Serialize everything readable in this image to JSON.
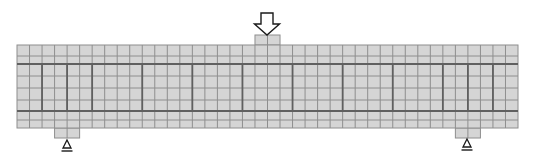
{
  "diagram": {
    "title": "Reinforced concrete beam finite element mesh with three-point loading",
    "canvas": {
      "width": 534,
      "height": 163
    },
    "colors": {
      "cell_fill": "#d5d5d5",
      "grid_line": "#8e8e8e",
      "rebar": "#606060",
      "stirrup": "#606060",
      "arrow_outline": "#1a1a1a",
      "arrow_fill": "#ffffff"
    },
    "beam": {
      "x": 17,
      "y": 45,
      "width": 501,
      "height": 83,
      "columns": 40,
      "row_lines_y": [
        56,
        64,
        76,
        88,
        100,
        111,
        120
      ]
    },
    "longitudinal_rebars": [
      {
        "name": "top-rebar",
        "y": 64
      },
      {
        "name": "bottom-rebar",
        "y": 111
      }
    ],
    "stirrups_column_index": [
      2,
      4,
      6,
      10,
      14,
      18,
      22,
      26,
      30,
      34,
      36,
      38
    ],
    "load_plate": {
      "name": "loading-plate",
      "col_start": 19,
      "col_count": 2,
      "y": 35,
      "height": 10
    },
    "support_plates": [
      {
        "name": "left-support-plate",
        "col_start": 3,
        "col_count": 2,
        "height": 10
      },
      {
        "name": "right-support-plate",
        "col_start": 35,
        "col_count": 2,
        "height": 10
      }
    ],
    "load_arrow": {
      "icon": "down-arrow-icon",
      "center_x": 267,
      "shaft_half_width": 6,
      "head_half_width": 12.5,
      "top_y": 13,
      "head_start_y": 24,
      "tip_y": 35
    },
    "supports": [
      {
        "icon": "pin-support-icon",
        "name": "left-support",
        "center_x": 67,
        "top_y": 140,
        "base_y": 148,
        "half_width": 4,
        "line_y": 151,
        "line_half_width": 5.5
      },
      {
        "icon": "pin-support-icon",
        "name": "right-support",
        "center_x": 467,
        "top_y": 139,
        "base_y": 147,
        "half_width": 4,
        "line_y": 150,
        "line_half_width": 5.5
      }
    ]
  }
}
